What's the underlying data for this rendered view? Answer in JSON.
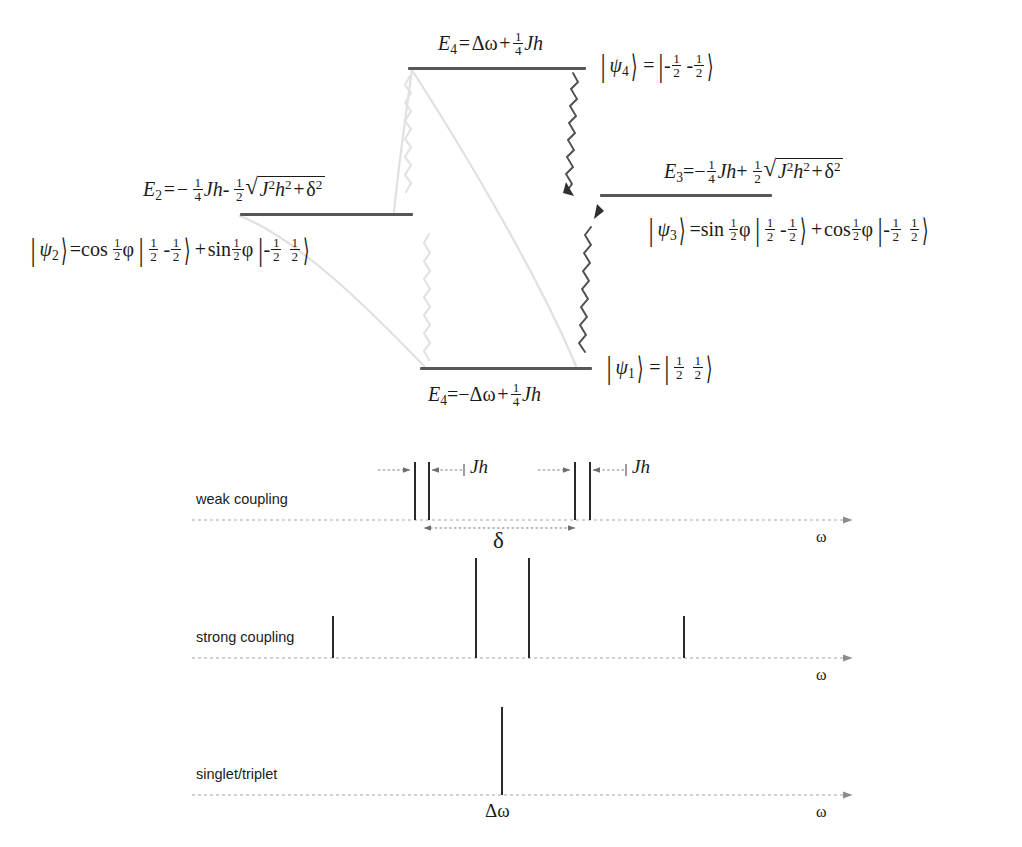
{
  "figure": {
    "type": "energy-level-and-spectrum-diagram"
  },
  "levels": {
    "psi4": {
      "energy_label": "E4 = Δω + 1/4 Jh",
      "state_label": "|ψ4⟩ = |-1/2 -1/2⟩",
      "E_symbol": "E",
      "E_sub": "4",
      "state_symbol": "ψ",
      "state_sub": "4"
    },
    "psi2": {
      "energy_label": "E2 = -1/4 Jh - 1/2 √(J²h² + δ²)",
      "state_label": "|ψ2⟩ = cos(1/2)ϕ |1/2 -1/2⟩ + sin(1/2)ϕ |-1/2 1/2⟩",
      "E_symbol": "E",
      "E_sub": "2",
      "state_symbol": "ψ",
      "state_sub": "2"
    },
    "psi3": {
      "energy_label": "E3 = -1/4 Jh + 1/2 √(J²h² + δ²)",
      "state_label": "|ψ3⟩ = sin(1/2)ϕ |1/2 -1/2⟩ + cos(1/2)ϕ |-1/2 1/2⟩",
      "E_symbol": "E",
      "E_sub": "3",
      "state_symbol": "ψ",
      "state_sub": "3"
    },
    "psi1": {
      "energy_label": "E4 = -Δω + 1/4 Jh",
      "state_label": "|ψ1⟩ = |1/2 1/2⟩",
      "E_symbol": "E",
      "E_sub": "4",
      "state_symbol": "ψ",
      "state_sub": "1"
    }
  },
  "symbols": {
    "J": "J",
    "h": "h",
    "Jh": "Jh",
    "delta": "δ",
    "phi": "ϕ",
    "omega": "ω",
    "delta_omega": "Δω",
    "psi": "ψ",
    "one": "1",
    "two": "2",
    "four": "4",
    "minus": "−",
    "plus": "+",
    "equals": "=",
    "cos": "cos",
    "sin": "sin",
    "sqrt": "√"
  },
  "spectra": {
    "rows": [
      {
        "name": "weak-coupling",
        "label": "weak coupling",
        "axis_label": "ω",
        "baseline_y": 520,
        "axis_x0": 192,
        "axis_x1": 860,
        "peaks": [
          {
            "x": 414,
            "height": 58
          },
          {
            "x": 428,
            "height": 58
          },
          {
            "x": 574,
            "height": 58
          },
          {
            "x": 589,
            "height": 58
          }
        ],
        "annotations": [
          {
            "name": "jh-left",
            "label": "Jh",
            "x": 472,
            "y": 464
          },
          {
            "name": "jh-right",
            "label": "Jh",
            "x": 633,
            "y": 464
          },
          {
            "name": "delta",
            "label": "δ",
            "x": 495,
            "y": 530
          }
        ]
      },
      {
        "name": "strong-coupling",
        "label": "strong coupling",
        "axis_label": "ω",
        "baseline_y": 658,
        "axis_x0": 192,
        "axis_x1": 860,
        "peaks": [
          {
            "x": 332,
            "height": 42
          },
          {
            "x": 475,
            "height": 100
          },
          {
            "x": 528,
            "height": 100
          },
          {
            "x": 683,
            "height": 42
          }
        ],
        "annotations": []
      },
      {
        "name": "singlet-triplet",
        "label": "singlet/triplet",
        "axis_label": "ω",
        "baseline_y": 795,
        "axis_x0": 192,
        "axis_x1": 860,
        "peaks": [
          {
            "x": 501,
            "height": 88
          }
        ],
        "annotations": [
          {
            "name": "delta-omega",
            "label": "Δω",
            "x": 487,
            "y": 800
          }
        ]
      }
    ]
  },
  "colors": {
    "level_bar": "#575757",
    "peak": "#2a2a2a",
    "axis": "#9b9b9b",
    "transition_active": "#4a4a4a",
    "transition_faded": "#dcdcdc",
    "text": "#1b1b1b",
    "background": "#ffffff"
  }
}
